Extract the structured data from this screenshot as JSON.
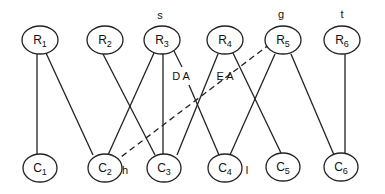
{
  "diagram": {
    "type": "bipartite-graph",
    "top_nodes": [
      {
        "id": "R1",
        "letter": "R",
        "sub": "1",
        "x": 40,
        "y": 40
      },
      {
        "id": "R2",
        "letter": "R",
        "sub": "2",
        "x": 105,
        "y": 40
      },
      {
        "id": "R3",
        "letter": "R",
        "sub": "3",
        "x": 162,
        "y": 40
      },
      {
        "id": "R4",
        "letter": "R",
        "sub": "4",
        "x": 225,
        "y": 40
      },
      {
        "id": "R5",
        "letter": "R",
        "sub": "5",
        "x": 283,
        "y": 40
      },
      {
        "id": "R6",
        "letter": "R",
        "sub": "6",
        "x": 342,
        "y": 40
      }
    ],
    "bottom_nodes": [
      {
        "id": "C1",
        "letter": "C",
        "sub": "1",
        "x": 40,
        "y": 168
      },
      {
        "id": "C2",
        "letter": "C",
        "sub": "2",
        "x": 105,
        "y": 168
      },
      {
        "id": "C3",
        "letter": "C",
        "sub": "3",
        "x": 162,
        "y": 168
      },
      {
        "id": "C4",
        "letter": "C",
        "sub": "4",
        "x": 225,
        "y": 168
      },
      {
        "id": "C5",
        "letter": "C",
        "sub": "5",
        "x": 283,
        "y": 168
      },
      {
        "id": "C6",
        "letter": "C",
        "sub": "6",
        "x": 342,
        "y": 167
      }
    ],
    "edges": [
      {
        "from": "R1",
        "to": "C1",
        "style": "solid"
      },
      {
        "from": "R1",
        "to": "C2",
        "style": "solid"
      },
      {
        "from": "R2",
        "to": "C3",
        "style": "solid"
      },
      {
        "from": "R3",
        "to": "C2",
        "style": "solid"
      },
      {
        "from": "R3",
        "to": "C3",
        "style": "solid"
      },
      {
        "from": "R3",
        "to": "C4",
        "style": "solid",
        "label": "DA"
      },
      {
        "from": "R4",
        "to": "C3",
        "style": "solid"
      },
      {
        "from": "R4",
        "to": "C5",
        "style": "solid"
      },
      {
        "from": "R5",
        "to": "C4",
        "style": "solid"
      },
      {
        "from": "R5",
        "to": "C6",
        "style": "solid"
      },
      {
        "from": "R5",
        "to": "C2",
        "style": "dashed",
        "label": "EA"
      },
      {
        "from": "R6",
        "to": "C6",
        "style": "solid"
      }
    ],
    "annotations": {
      "s": "s",
      "g": "g",
      "t": "t",
      "h": "h",
      "l": "l",
      "da": "D A",
      "ea": "E A"
    }
  }
}
